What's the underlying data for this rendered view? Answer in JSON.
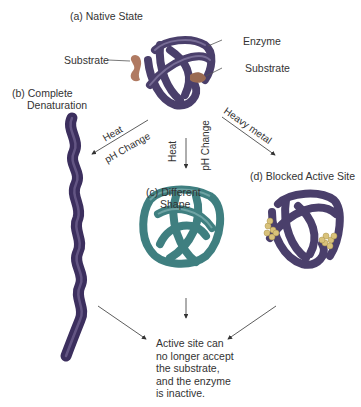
{
  "title_native": "(a) Native State",
  "enzyme_label": "Enzyme",
  "substrate_left_label": "Substrate",
  "substrate_right_label": "Substrate",
  "panel_b": {
    "line1": "(b) Complete",
    "line2": "Denaturation"
  },
  "panel_c": {
    "line1": "(c) Different",
    "line2": "Shape"
  },
  "panel_d": {
    "label": "(d) Blocked Active Site"
  },
  "arrows": {
    "left": {
      "line1": "Heat",
      "line2": "pH Change"
    },
    "middle": {
      "line1": "Heat",
      "line2": "pH Change"
    },
    "right": {
      "line1": "Heavy metal"
    }
  },
  "conclusion": {
    "lines": [
      "Active site can",
      "no longer accept",
      "the substrate,",
      "and the enzyme",
      "is inactive."
    ]
  },
  "colors": {
    "enzyme_purple": "#4a3f6b",
    "enzyme_highlight": "#8a7fa8",
    "substrate": "#b07a62",
    "different_shape_teal": "#3f7f80",
    "heavy_metal": "#d9c27a",
    "text": "#333333"
  }
}
